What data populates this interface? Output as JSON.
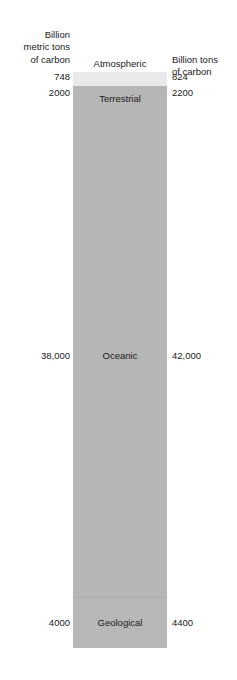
{
  "figure": {
    "background_color": "#ffffff",
    "bar_color": "#b6b6b6",
    "atmospheric_band_color": "#e9e9e9",
    "geological_band_color": "#b8b8b8"
  },
  "left_column": {
    "header_line1": "Billion",
    "header_line2": "metric tons",
    "header_line3": "of carbon",
    "values": {
      "atmospheric": "748",
      "terrestrial": "2000",
      "oceanic": "38,000",
      "geological": "4000"
    }
  },
  "right_column": {
    "header_line1": "Billion tons",
    "header_line2": "of carbon",
    "values": {
      "atmospheric": "824",
      "terrestrial": "2200",
      "oceanic": "42,000",
      "geological": "4400"
    }
  },
  "segments": {
    "atmospheric": "Atmospheric",
    "terrestrial": "Terrestrial",
    "oceanic": "Oceanic",
    "geological": "Geological"
  },
  "chart_data": {
    "type": "bar",
    "title": "",
    "subtype": "stacked-vertical-single-column",
    "orientation": "vertical",
    "stacked": true,
    "grid": false,
    "legend": false,
    "xlabel": "",
    "ylabel": "",
    "categories": [
      "Atmospheric",
      "Terrestrial",
      "Oceanic",
      "Geological"
    ],
    "series": [
      {
        "name": "Billion metric tons of carbon",
        "axis": "left",
        "values": [
          748,
          2000,
          38000,
          4000
        ],
        "value_labels": [
          "748",
          "2000",
          "38,000",
          "4000"
        ]
      },
      {
        "name": "Billion tons of carbon",
        "axis": "right",
        "values": [
          824,
          2200,
          42000,
          4400
        ],
        "value_labels": [
          "824",
          "2200",
          "42,000",
          "4400"
        ]
      }
    ],
    "annotations": [
      "Atmospheric label is placed above the top of the bar",
      "Terrestrial, Oceanic and Geological labels are placed inside their segments"
    ]
  }
}
